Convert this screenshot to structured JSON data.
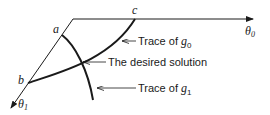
{
  "diagram": {
    "points": {
      "a": "a",
      "b": "b",
      "c": "c"
    },
    "axes": {
      "theta0": {
        "symbol": "θ",
        "sub": "0"
      },
      "theta1": {
        "symbol": "θ",
        "sub": "1"
      }
    },
    "labels": {
      "g0": {
        "prefix": "Trace of ",
        "symbol": "g",
        "sub": "0"
      },
      "solution": "The desired solution",
      "g1": {
        "prefix": "Trace of ",
        "symbol": "g",
        "sub": "1"
      }
    },
    "colors": {
      "ink": "#1a1a1a",
      "background": "#ffffff"
    }
  }
}
